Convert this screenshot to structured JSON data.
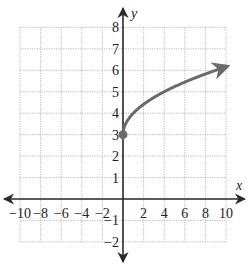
{
  "chart_data": {
    "type": "line",
    "title": "",
    "function": "y = sqrt(x) + 3",
    "xlabel": "x",
    "ylabel": "y",
    "xlim": [
      -10,
      10
    ],
    "ylim": [
      -2,
      8
    ],
    "grid": true,
    "x_ticks": [
      -10,
      -8,
      -6,
      -4,
      -2,
      2,
      4,
      6,
      8,
      10
    ],
    "x_tick_labels": [
      "−10",
      "−8",
      "−6",
      "−4",
      "−2",
      "2",
      "4",
      "6",
      "8",
      "10"
    ],
    "y_ticks": [
      8,
      7,
      6,
      5,
      4,
      3,
      2,
      1,
      -1,
      -2
    ],
    "y_tick_labels": [
      "8",
      "7",
      "6",
      "5",
      "4",
      "3",
      "2",
      "1",
      "−1",
      "−2"
    ],
    "series": [
      {
        "name": "curve",
        "x": [
          0,
          1,
          2,
          3,
          4,
          5,
          6,
          7,
          8,
          9,
          10
        ],
        "y": [
          3,
          4,
          4.41,
          4.73,
          5,
          5.24,
          5.45,
          5.65,
          5.83,
          6,
          6.16
        ],
        "start_point": {
          "x": 0,
          "y": 3,
          "closed": true
        },
        "end_arrow": true,
        "color": "#6b6b6b"
      }
    ],
    "axis_color": "#2a2a2a",
    "grid_color": "#b8b8b8"
  }
}
